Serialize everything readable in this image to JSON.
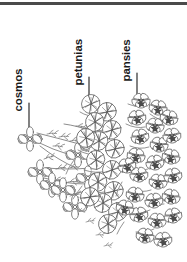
{
  "figure": {
    "type": "botanical-line-illustration",
    "background_color": "#ffffff",
    "ink_color": "#4a4a4a",
    "top_rule_color": "#4a4a4a"
  },
  "callouts": [
    {
      "id": "cosmos",
      "label": "cosmos",
      "leader": "vertical-line"
    },
    {
      "id": "petunias",
      "label": "petunias",
      "leader": "vertical-line"
    },
    {
      "id": "pansies",
      "label": "pansies",
      "leader": "vertical-line"
    }
  ]
}
